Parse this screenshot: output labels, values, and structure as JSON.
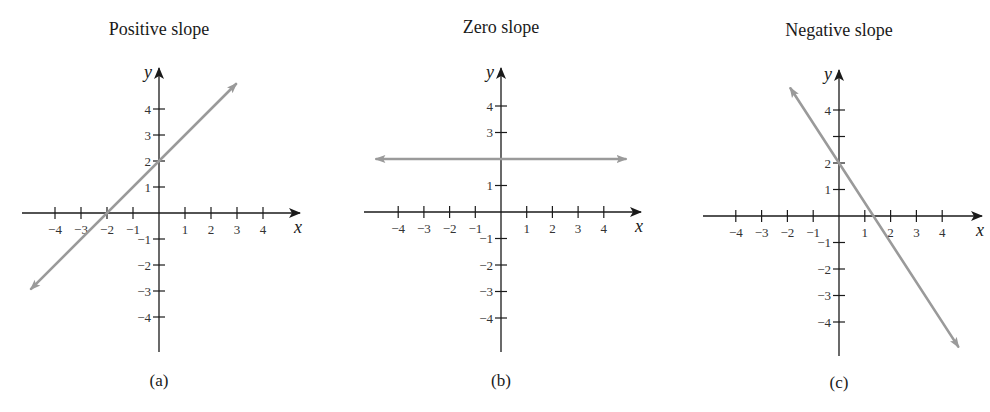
{
  "colors": {
    "axis": "#1a1a1a",
    "line": "#9a9a9a",
    "background": "#ffffff"
  },
  "chart_data": [
    {
      "type": "line",
      "title": "Positive slope",
      "caption": "(a)",
      "xlabel": "x",
      "ylabel": "y",
      "x_ticks": [
        -4,
        -3,
        -2,
        -1,
        1,
        2,
        3,
        4
      ],
      "x_tick_labels": [
        "−4",
        "−3",
        "−2",
        "−1",
        "1",
        "2",
        "3",
        "4"
      ],
      "y_ticks": [
        -4,
        -3,
        -2,
        -1,
        1,
        2,
        3,
        4
      ],
      "y_tick_labels": [
        "−4",
        "−3",
        "−2",
        "−1",
        "1",
        "2",
        "3",
        "4"
      ],
      "xlim": [
        -5,
        5.4
      ],
      "ylim": [
        -5.4,
        5.6
      ],
      "grid": false,
      "equation": "y = x + 2",
      "slope": 1,
      "y_intercept": 2,
      "x_intercept": -2,
      "series": [
        {
          "name": "line",
          "x": [
            -4.92,
            2.96
          ],
          "y": [
            -2.92,
            4.96
          ],
          "arrows": "both"
        }
      ]
    },
    {
      "type": "line",
      "title": "Zero slope",
      "caption": "(b)",
      "xlabel": "x",
      "ylabel": "y",
      "x_ticks": [
        -4,
        -3,
        -2,
        -1,
        1,
        2,
        3,
        4
      ],
      "x_tick_labels": [
        "−4",
        "−3",
        "−2",
        "−1",
        "1",
        "2",
        "3",
        "4"
      ],
      "y_ticks": [
        -4,
        -3,
        -2,
        -1,
        1,
        2,
        3,
        4
      ],
      "y_tick_labels": [
        "−4",
        "−3",
        "−2",
        "−1",
        "1",
        "",
        "3",
        "4"
      ],
      "xlim": [
        -5.3,
        5.5
      ],
      "ylim": [
        -5.4,
        5.6
      ],
      "grid": false,
      "equation": "y = 2",
      "slope": 0,
      "y_intercept": 2,
      "series": [
        {
          "name": "line",
          "x": [
            -4.85,
            4.85
          ],
          "y": [
            2,
            2
          ],
          "arrows": "both"
        }
      ]
    },
    {
      "type": "line",
      "title": "Negative slope",
      "caption": "(c)",
      "xlabel": "x",
      "ylabel": "y",
      "x_ticks": [
        -4,
        -3,
        -2,
        -1,
        1,
        2,
        3,
        4
      ],
      "x_tick_labels": [
        "−4",
        "−3",
        "−2",
        "−1",
        "1",
        "2",
        "3",
        "4"
      ],
      "y_ticks": [
        -4,
        -3,
        -2,
        -1,
        1,
        2,
        3,
        4
      ],
      "y_tick_labels": [
        "−4",
        "−3",
        "−2",
        "−1",
        "1",
        "2",
        "",
        "4"
      ],
      "xlim": [
        -5.2,
        5.5
      ],
      "ylim": [
        -5.4,
        5.6
      ],
      "grid": false,
      "equation": "y = -1.5x + 2",
      "slope": -1.5,
      "y_intercept": 2,
      "x_intercept": 1.333,
      "series": [
        {
          "name": "line",
          "x": [
            -1.88,
            4.62
          ],
          "y": [
            4.82,
            -4.93
          ],
          "arrows": "both"
        }
      ]
    }
  ]
}
